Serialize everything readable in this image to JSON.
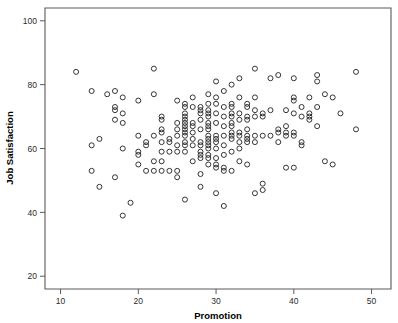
{
  "chart_data": {
    "type": "scatter",
    "title": "",
    "xlabel": "Promotion",
    "ylabel": "Job Satisfaction",
    "xlim": [
      8,
      52.5
    ],
    "ylim": [
      16,
      104
    ],
    "grid": false,
    "legend": null,
    "xticks": [
      10,
      20,
      30,
      40,
      50
    ],
    "xtick_labels": [
      "10",
      "20",
      "30",
      "40",
      "50"
    ],
    "yticks": [
      20,
      40,
      60,
      80,
      100
    ],
    "ytick_labels": [
      "20",
      "40",
      "60",
      "80",
      "100"
    ],
    "marker": "open-circle",
    "marker_color": "#2a2a2a",
    "marker_size": 5,
    "n_points": 203,
    "points": [
      [
        12,
        84
      ],
      [
        14,
        78
      ],
      [
        14,
        53
      ],
      [
        14,
        61
      ],
      [
        15,
        48
      ],
      [
        15,
        63
      ],
      [
        16,
        77
      ],
      [
        17,
        78
      ],
      [
        17,
        73
      ],
      [
        17,
        69
      ],
      [
        17,
        51
      ],
      [
        17,
        72
      ],
      [
        18,
        76
      ],
      [
        18,
        71
      ],
      [
        18,
        68
      ],
      [
        18,
        60
      ],
      [
        18,
        39
      ],
      [
        19,
        43
      ],
      [
        20,
        75
      ],
      [
        20,
        64
      ],
      [
        20,
        59
      ],
      [
        20,
        58
      ],
      [
        20,
        55
      ],
      [
        21,
        61
      ],
      [
        21,
        62
      ],
      [
        21,
        53
      ],
      [
        22,
        85
      ],
      [
        22,
        77
      ],
      [
        22,
        64
      ],
      [
        22,
        56
      ],
      [
        22,
        53
      ],
      [
        23,
        70
      ],
      [
        23,
        69
      ],
      [
        23,
        66
      ],
      [
        23,
        65
      ],
      [
        23,
        62
      ],
      [
        23,
        59
      ],
      [
        23,
        56
      ],
      [
        23,
        53
      ],
      [
        24,
        63
      ],
      [
        24,
        62
      ],
      [
        24,
        59
      ],
      [
        24,
        53
      ],
      [
        25,
        75
      ],
      [
        25,
        68
      ],
      [
        25,
        66
      ],
      [
        25,
        64
      ],
      [
        25,
        61
      ],
      [
        25,
        59
      ],
      [
        25,
        53
      ],
      [
        25,
        51
      ],
      [
        26,
        74
      ],
      [
        26,
        73
      ],
      [
        26,
        71
      ],
      [
        26,
        70
      ],
      [
        26,
        69
      ],
      [
        26,
        68
      ],
      [
        26,
        67
      ],
      [
        26,
        66
      ],
      [
        26,
        65
      ],
      [
        26,
        64
      ],
      [
        26,
        62
      ],
      [
        26,
        61
      ],
      [
        26,
        59
      ],
      [
        26,
        44
      ],
      [
        27,
        76
      ],
      [
        27,
        73
      ],
      [
        27,
        68
      ],
      [
        27,
        67
      ],
      [
        27,
        65
      ],
      [
        27,
        63
      ],
      [
        27,
        61
      ],
      [
        27,
        56
      ],
      [
        28,
        73
      ],
      [
        28,
        72
      ],
      [
        28,
        71
      ],
      [
        28,
        69
      ],
      [
        28,
        66
      ],
      [
        28,
        62
      ],
      [
        28,
        61
      ],
      [
        28,
        59
      ],
      [
        28,
        58
      ],
      [
        28,
        57
      ],
      [
        28,
        52
      ],
      [
        28,
        48
      ],
      [
        29,
        77
      ],
      [
        29,
        74
      ],
      [
        29,
        72
      ],
      [
        29,
        71
      ],
      [
        29,
        70
      ],
      [
        29,
        68
      ],
      [
        29,
        67
      ],
      [
        29,
        66
      ],
      [
        29,
        64
      ],
      [
        29,
        63
      ],
      [
        29,
        62
      ],
      [
        29,
        61
      ],
      [
        29,
        60
      ],
      [
        29,
        58
      ],
      [
        29,
        57
      ],
      [
        29,
        55
      ],
      [
        30,
        81
      ],
      [
        30,
        76
      ],
      [
        30,
        74
      ],
      [
        30,
        71
      ],
      [
        30,
        68
      ],
      [
        30,
        64
      ],
      [
        30,
        63
      ],
      [
        30,
        62
      ],
      [
        30,
        60
      ],
      [
        30,
        57
      ],
      [
        30,
        55
      ],
      [
        30,
        54
      ],
      [
        30,
        46
      ],
      [
        31,
        78
      ],
      [
        31,
        73
      ],
      [
        31,
        70
      ],
      [
        31,
        67
      ],
      [
        31,
        64
      ],
      [
        31,
        61
      ],
      [
        31,
        58
      ],
      [
        31,
        54
      ],
      [
        31,
        53
      ],
      [
        31,
        42
      ],
      [
        32,
        80
      ],
      [
        32,
        74
      ],
      [
        32,
        73
      ],
      [
        32,
        71
      ],
      [
        32,
        70
      ],
      [
        32,
        68
      ],
      [
        32,
        67
      ],
      [
        32,
        65
      ],
      [
        32,
        64
      ],
      [
        32,
        63
      ],
      [
        32,
        59
      ],
      [
        32,
        53
      ],
      [
        33,
        82
      ],
      [
        33,
        76
      ],
      [
        33,
        71
      ],
      [
        33,
        69
      ],
      [
        33,
        65
      ],
      [
        33,
        64
      ],
      [
        33,
        62
      ],
      [
        33,
        60
      ],
      [
        33,
        56
      ],
      [
        34,
        74
      ],
      [
        34,
        73
      ],
      [
        34,
        70
      ],
      [
        34,
        69
      ],
      [
        34,
        66
      ],
      [
        34,
        64
      ],
      [
        34,
        63
      ],
      [
        34,
        62
      ],
      [
        34,
        55
      ],
      [
        35,
        85
      ],
      [
        35,
        76
      ],
      [
        35,
        72
      ],
      [
        35,
        70
      ],
      [
        35,
        64
      ],
      [
        35,
        62
      ],
      [
        35,
        46
      ],
      [
        36,
        71
      ],
      [
        36,
        70
      ],
      [
        36,
        64
      ],
      [
        36,
        49
      ],
      [
        36,
        47
      ],
      [
        37,
        82
      ],
      [
        37,
        72
      ],
      [
        37,
        64
      ],
      [
        38,
        83
      ],
      [
        38,
        66
      ],
      [
        38,
        65
      ],
      [
        38,
        62
      ],
      [
        39,
        72
      ],
      [
        39,
        67
      ],
      [
        39,
        65
      ],
      [
        39,
        64
      ],
      [
        39,
        54
      ],
      [
        40,
        82
      ],
      [
        40,
        76
      ],
      [
        40,
        75
      ],
      [
        40,
        71
      ],
      [
        40,
        65
      ],
      [
        40,
        64
      ],
      [
        40,
        54
      ],
      [
        41,
        73
      ],
      [
        41,
        70
      ],
      [
        41,
        62
      ],
      [
        41,
        61
      ],
      [
        42,
        76
      ],
      [
        42,
        71
      ],
      [
        42,
        70
      ],
      [
        42,
        69
      ],
      [
        43,
        83
      ],
      [
        43,
        81
      ],
      [
        43,
        73
      ],
      [
        43,
        67
      ],
      [
        44,
        77
      ],
      [
        44,
        56
      ],
      [
        45,
        76
      ],
      [
        45,
        55
      ],
      [
        46,
        71
      ],
      [
        48,
        84
      ],
      [
        48,
        66
      ]
    ]
  },
  "axes": {
    "x_title": "Promotion",
    "y_title": "Job Satisfaction"
  }
}
